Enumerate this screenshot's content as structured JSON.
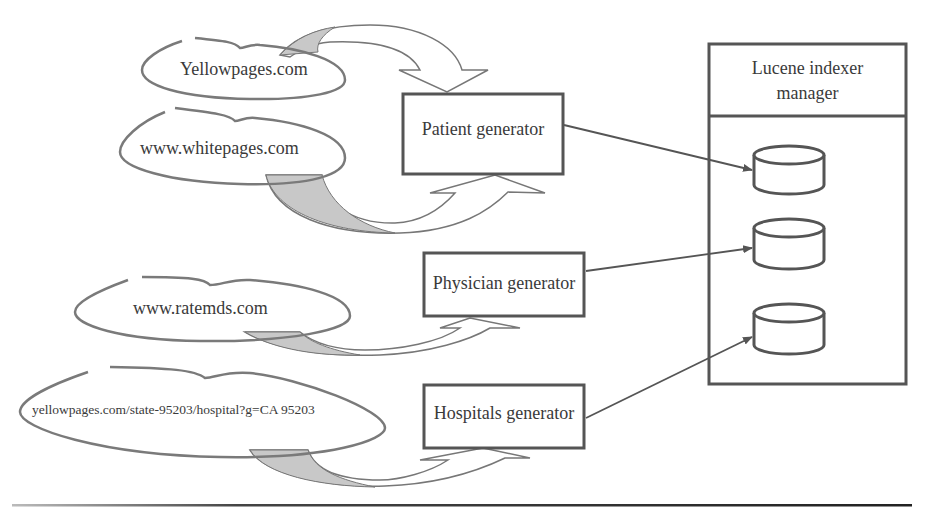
{
  "diagram": {
    "type": "data-flow",
    "sources": [
      {
        "id": "src-yellowpages",
        "label": "Yellowpages.com"
      },
      {
        "id": "src-whitepages",
        "label": "www.whitepages.com"
      },
      {
        "id": "src-ratemds",
        "label": "www.ratemds.com"
      },
      {
        "id": "src-hospital-yp",
        "label": "yellowpages.com/state-95203/hospital?g=CA 95203"
      }
    ],
    "generators": [
      {
        "id": "gen-patient",
        "label": "Patient generator"
      },
      {
        "id": "gen-physician",
        "label": "Physician generator"
      },
      {
        "id": "gen-hospitals",
        "label": "Hospitals generator"
      }
    ],
    "manager": {
      "title_line1": "Lucene indexer",
      "title_line2": "manager",
      "indexes": [
        {
          "id": "index-1",
          "shape": "database-cylinder"
        },
        {
          "id": "index-2",
          "shape": "database-cylinder"
        },
        {
          "id": "index-3",
          "shape": "database-cylinder"
        }
      ]
    },
    "edges": [
      {
        "from": "src-yellowpages",
        "to": "gen-patient",
        "style": "curved-block-arrow"
      },
      {
        "from": "src-whitepages",
        "to": "gen-patient",
        "style": "curved-block-arrow"
      },
      {
        "from": "src-ratemds",
        "to": "gen-physician",
        "style": "curved-block-arrow"
      },
      {
        "from": "src-hospital-yp",
        "to": "gen-hospitals",
        "style": "curved-block-arrow"
      },
      {
        "from": "gen-patient",
        "to": "index-1",
        "style": "line-arrow"
      },
      {
        "from": "gen-physician",
        "to": "index-2",
        "style": "line-arrow"
      },
      {
        "from": "gen-hospitals",
        "to": "index-3",
        "style": "line-arrow"
      }
    ],
    "colors": {
      "stroke": "#555555",
      "bubble_stroke": "#7a7a7a",
      "arrow_shade": "#c8c8c8",
      "text": "#3a3a3a"
    }
  }
}
